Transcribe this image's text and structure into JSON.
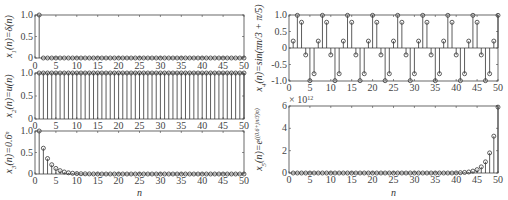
{
  "figure": {
    "x_label": "n",
    "x_ticks": [
      0,
      5,
      10,
      15,
      20,
      25,
      30,
      35,
      40,
      45,
      50
    ],
    "colors": {
      "stem": "#333333",
      "axis": "#444444",
      "marker": "#333333"
    }
  },
  "chart_data": [
    {
      "type": "stem",
      "id": "x1",
      "ylabel": "x1(n)=δ(n)",
      "xlim": [
        0,
        50
      ],
      "ylim": [
        0,
        1
      ],
      "y_ticks": [
        "0",
        "0.5",
        "1.0"
      ],
      "x": [
        1,
        2,
        3,
        4,
        5,
        6,
        7,
        8,
        9,
        10,
        11,
        12,
        13,
        14,
        15,
        16,
        17,
        18,
        19,
        20,
        21,
        22,
        23,
        24,
        25,
        26,
        27,
        28,
        29,
        30,
        31,
        32,
        33,
        34,
        35,
        36,
        37,
        38,
        39,
        40,
        41,
        42,
        43,
        44,
        45,
        46,
        47,
        48,
        49,
        50
      ],
      "values": [
        1,
        0,
        0,
        0,
        0,
        0,
        0,
        0,
        0,
        0,
        0,
        0,
        0,
        0,
        0,
        0,
        0,
        0,
        0,
        0,
        0,
        0,
        0,
        0,
        0,
        0,
        0,
        0,
        0,
        0,
        0,
        0,
        0,
        0,
        0,
        0,
        0,
        0,
        0,
        0,
        0,
        0,
        0,
        0,
        0,
        0,
        0,
        0,
        0,
        0
      ]
    },
    {
      "type": "stem",
      "id": "x2",
      "ylabel": "x2(n)=u(n)",
      "xlim": [
        0,
        50
      ],
      "ylim": [
        0,
        1
      ],
      "y_ticks": [
        "0",
        "0.5",
        "1.0"
      ],
      "x": [
        1,
        2,
        3,
        4,
        5,
        6,
        7,
        8,
        9,
        10,
        11,
        12,
        13,
        14,
        15,
        16,
        17,
        18,
        19,
        20,
        21,
        22,
        23,
        24,
        25,
        26,
        27,
        28,
        29,
        30,
        31,
        32,
        33,
        34,
        35,
        36,
        37,
        38,
        39,
        40,
        41,
        42,
        43,
        44,
        45,
        46,
        47,
        48,
        49,
        50
      ],
      "values": [
        1,
        1,
        1,
        1,
        1,
        1,
        1,
        1,
        1,
        1,
        1,
        1,
        1,
        1,
        1,
        1,
        1,
        1,
        1,
        1,
        1,
        1,
        1,
        1,
        1,
        1,
        1,
        1,
        1,
        1,
        1,
        1,
        1,
        1,
        1,
        1,
        1,
        1,
        1,
        1,
        1,
        1,
        1,
        1,
        1,
        1,
        1,
        1,
        1,
        1
      ]
    },
    {
      "type": "stem",
      "id": "x3",
      "ylabel": "x3(n)=0.6^n",
      "xlabel": "n",
      "xlim": [
        0,
        50
      ],
      "ylim": [
        0,
        1
      ],
      "y_ticks": [
        "0",
        "0.5",
        "1.0"
      ],
      "x": [
        1,
        2,
        3,
        4,
        5,
        6,
        7,
        8,
        9,
        10,
        11,
        12,
        13,
        14,
        15,
        16,
        17,
        18,
        19,
        20,
        21,
        22,
        23,
        24,
        25,
        26,
        27,
        28,
        29,
        30,
        31,
        32,
        33,
        34,
        35,
        36,
        37,
        38,
        39,
        40,
        41,
        42,
        43,
        44,
        45,
        46,
        47,
        48,
        49,
        50
      ],
      "values": [
        1,
        0.6,
        0.36,
        0.216,
        0.13,
        0.078,
        0.047,
        0.028,
        0.017,
        0.01,
        0.006,
        0.004,
        0.002,
        0.001,
        0.001,
        0,
        0,
        0,
        0,
        0,
        0,
        0,
        0,
        0,
        0,
        0,
        0,
        0,
        0,
        0,
        0,
        0,
        0,
        0,
        0,
        0,
        0,
        0,
        0,
        0,
        0,
        0,
        0,
        0,
        0,
        0,
        0,
        0,
        0,
        0
      ]
    },
    {
      "type": "stem",
      "id": "x4",
      "ylabel": "x4(n)=sin(πn/3 + π/5)",
      "xlim": [
        0,
        50
      ],
      "ylim": [
        -1,
        1
      ],
      "y_ticks": [
        "-1.0",
        "-0.5",
        "0",
        "0.5",
        "1.0"
      ],
      "x": [
        1,
        2,
        3,
        4,
        5,
        6,
        7,
        8,
        9,
        10,
        11,
        12,
        13,
        14,
        15,
        16,
        17,
        18,
        19,
        20,
        21,
        22,
        23,
        24,
        25,
        26,
        27,
        28,
        29,
        30,
        31,
        32,
        33,
        34,
        35,
        36,
        37,
        38,
        39,
        40,
        41,
        42,
        43,
        44,
        45,
        46,
        47,
        48,
        49,
        50
      ],
      "values": [
        0.21,
        0.99,
        0.78,
        -0.21,
        -0.99,
        -0.78,
        0.21,
        0.99,
        0.78,
        -0.21,
        -0.99,
        -0.78,
        0.21,
        0.99,
        0.78,
        -0.21,
        -0.99,
        -0.78,
        0.21,
        0.99,
        0.78,
        -0.21,
        -0.99,
        -0.78,
        0.21,
        0.99,
        0.78,
        -0.21,
        -0.99,
        -0.78,
        0.21,
        0.99,
        0.78,
        -0.21,
        -0.99,
        -0.78,
        0.21,
        0.99,
        0.78,
        -0.21,
        -0.99,
        -0.78,
        0.21,
        0.99,
        0.78,
        -0.21,
        -0.99,
        -0.78,
        0.21,
        0.99
      ]
    },
    {
      "type": "stem",
      "id": "x5",
      "ylabel": "x5(n)=e^((0.6+jπ/3)n)",
      "xlabel": "n",
      "xlim": [
        0,
        50
      ],
      "ylim": [
        0,
        6
      ],
      "y_ticks": [
        "0",
        "2",
        "4",
        "6"
      ],
      "y_scale_label": "× 10^12",
      "x": [
        1,
        2,
        3,
        4,
        5,
        6,
        7,
        8,
        9,
        10,
        11,
        12,
        13,
        14,
        15,
        16,
        17,
        18,
        19,
        20,
        21,
        22,
        23,
        24,
        25,
        26,
        27,
        28,
        29,
        30,
        31,
        32,
        33,
        34,
        35,
        36,
        37,
        38,
        39,
        40,
        41,
        42,
        43,
        44,
        45,
        46,
        47,
        48,
        49,
        50
      ],
      "values": [
        0,
        0,
        0,
        0,
        0,
        0,
        0,
        0,
        0,
        0,
        0,
        0,
        0,
        0,
        0,
        0,
        0,
        0,
        0,
        0,
        0,
        0,
        0,
        0,
        0,
        0,
        0,
        0,
        0,
        0,
        0,
        0,
        0,
        0,
        0,
        0,
        0,
        0,
        0,
        0.01,
        0.03,
        0.05,
        0.09,
        0.17,
        0.3,
        0.55,
        1.0,
        1.8,
        3.3,
        5.9
      ]
    }
  ],
  "layout": {
    "panels": [
      {
        "left": 35,
        "top": 15,
        "width": 209,
        "height": 43,
        "ylab_x": 12,
        "xticks_y": 69
      },
      {
        "left": 35,
        "top": 73,
        "width": 209,
        "height": 46,
        "ylab_x": 12,
        "xticks_y": 129
      },
      {
        "left": 35,
        "top": 131,
        "width": 209,
        "height": 43,
        "ylab_x": 12,
        "xticks_y": 184,
        "xlabel_y": 196
      },
      {
        "left": 289,
        "top": 15,
        "width": 209,
        "height": 66,
        "ylab_x": 262,
        "xticks_y": 91
      },
      {
        "left": 289,
        "top": 106,
        "width": 209,
        "height": 67,
        "ylab_x": 262,
        "xticks_y": 183,
        "xlabel_y": 196
      }
    ]
  }
}
